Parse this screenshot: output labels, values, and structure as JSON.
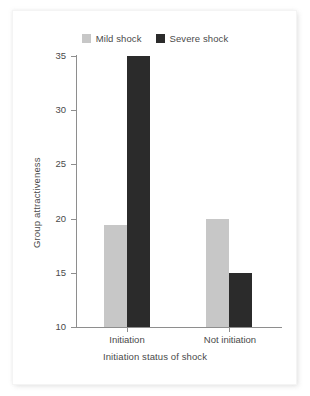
{
  "chart_data": {
    "type": "bar",
    "title": "",
    "subtitle": "",
    "xlabel": "Initiation status of shock",
    "ylabel": "Group attractiveness",
    "categories": [
      "Initiation",
      "Not initiation"
    ],
    "series": [
      {
        "name": "Mild shock",
        "values": [
          19.4,
          20.0
        ],
        "color": "#c7c7c7"
      },
      {
        "name": "Severe shock",
        "values": [
          35.0,
          15.0
        ],
        "color": "#2b2b2b"
      }
    ],
    "ylim": [
      10,
      35
    ],
    "yticks": [
      10,
      15,
      20,
      25,
      30,
      35
    ],
    "ytick_labels": [
      "10",
      "15",
      "20",
      "25",
      "30",
      "35"
    ],
    "grid": false,
    "legend_position": "top-center"
  },
  "legend": {
    "entries": [
      {
        "label": "Mild shock",
        "swatch_color": "#c7c7c7",
        "swatch_name": "legend-swatch-mild-shock"
      },
      {
        "label": "Severe shock",
        "swatch_color": "#2b2b2b",
        "swatch_name": "legend-swatch-severe-shock"
      }
    ]
  },
  "axes": {
    "y_title": "Group attractiveness",
    "x_title": "Initiation status of shock",
    "y_tick_labels": [
      "35",
      "30",
      "25",
      "20",
      "15",
      "10"
    ],
    "x_tick_labels": [
      "Initiation",
      "Not initiation"
    ]
  },
  "colors": {
    "axis": "#8e8e8e",
    "text": "#4a4a4a",
    "background": "#ffffff",
    "mild_shock": "#c7c7c7",
    "severe_shock": "#2b2b2b"
  }
}
